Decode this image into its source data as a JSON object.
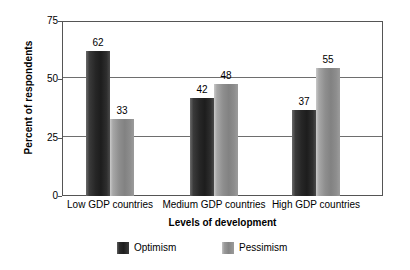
{
  "chart_data": {
    "type": "bar",
    "title": "",
    "xlabel": "Levels of development",
    "ylabel": "Percent of respondents",
    "categories": [
      "Low GDP countries",
      "Medium GDP countries",
      "High GDP countries"
    ],
    "series": [
      {
        "name": "Optimism",
        "values": [
          62,
          42,
          37
        ],
        "color": "#262626"
      },
      {
        "name": "Pessimism",
        "values": [
          33,
          48,
          55
        ],
        "color": "#8e8e8e"
      }
    ],
    "ylim": [
      0,
      75
    ],
    "yticks": [
      0,
      25,
      50,
      75
    ],
    "ytick_labels": [
      "0",
      "25",
      "50",
      "75"
    ],
    "grid": true,
    "grid_axis": "y",
    "legend_position": "bottom",
    "data_labels": true
  },
  "axes": {
    "y_title": "Percent of respondents",
    "x_title": "Levels of development",
    "y_ticks": [
      {
        "label": "75",
        "value": 75
      },
      {
        "label": "50",
        "value": 50
      },
      {
        "label": "25",
        "value": 25
      },
      {
        "label": "0",
        "value": 0
      }
    ],
    "x_ticks": [
      {
        "label": "Low GDP countries"
      },
      {
        "label": "Medium GDP countries"
      },
      {
        "label": "High GDP countries"
      }
    ]
  },
  "groups": [
    {
      "category": "Low GDP countries",
      "bars": [
        {
          "series": "Optimism",
          "value": 62,
          "label": "62"
        },
        {
          "series": "Pessimism",
          "value": 33,
          "label": "33"
        }
      ]
    },
    {
      "category": "Medium GDP countries",
      "bars": [
        {
          "series": "Optimism",
          "value": 42,
          "label": "42"
        },
        {
          "series": "Pessimism",
          "value": 48,
          "label": "48"
        }
      ]
    },
    {
      "category": "High GDP countries",
      "bars": [
        {
          "series": "Optimism",
          "value": 37,
          "label": "37"
        },
        {
          "series": "Pessimism",
          "value": 55,
          "label": "55"
        }
      ]
    }
  ],
  "legend": {
    "items": [
      {
        "label": "Optimism",
        "swatch": "optimism"
      },
      {
        "label": "Pessimism",
        "swatch": "pessimism"
      }
    ]
  },
  "colors": {
    "optimism": "#262626",
    "pessimism": "#8e8e8e",
    "frame": "#555555",
    "gridline": "#6e6e6e",
    "background": "#ffffff"
  }
}
